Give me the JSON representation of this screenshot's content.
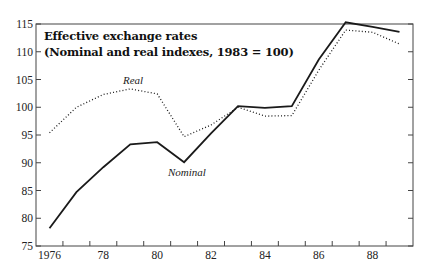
{
  "chart_data": {
    "type": "line",
    "title": "Effective exchange rates",
    "subtitle": "(Nominal and real indexes, 1983 = 100)",
    "xlabel": "",
    "ylabel": "",
    "x": [
      1976,
      1977,
      1978,
      1979,
      1980,
      1981,
      1982,
      1983,
      1984,
      1985,
      1986,
      1987,
      1988,
      1989
    ],
    "x_tick_labels": [
      "1976",
      "78",
      "80",
      "82",
      "84",
      "86",
      "88"
    ],
    "x_tick_label_years": [
      1976,
      1978,
      1980,
      1982,
      1984,
      1986,
      1988
    ],
    "y_ticks": [
      75,
      80,
      85,
      90,
      95,
      100,
      105,
      110,
      115
    ],
    "ylim": [
      75,
      115
    ],
    "grid": false,
    "legend": "inline labels",
    "series": [
      {
        "name": "Nominal",
        "style": "solid",
        "color": "#1a1a1a",
        "values": [
          78.2,
          84.7,
          89.2,
          93.3,
          93.7,
          90.1,
          95.3,
          100.2,
          99.9,
          100.2,
          108.6,
          115.3,
          114.5,
          113.6
        ],
        "label_position": {
          "x": 168,
          "y": 176
        }
      },
      {
        "name": "Real",
        "style": "dotted",
        "color": "#1a1a1a",
        "values": [
          95.4,
          100.0,
          102.3,
          103.3,
          102.4,
          94.7,
          96.8,
          100.0,
          98.4,
          98.5,
          106.7,
          113.9,
          113.5,
          111.4
        ],
        "label_position": {
          "x": 123,
          "y": 84
        }
      }
    ]
  }
}
